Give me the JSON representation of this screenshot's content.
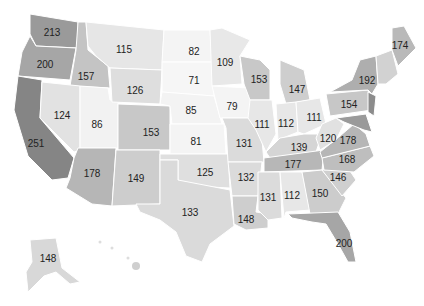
{
  "chart_data": {
    "type": "choropleth",
    "title": "",
    "colorscale": "grayscale (higher = darker)",
    "states": [
      {
        "id": "WA",
        "value": 213,
        "x": 52,
        "y": 32,
        "fill": "#9a9a9a"
      },
      {
        "id": "OR",
        "value": 200,
        "x": 45,
        "y": 64,
        "fill": "#a6a6a6"
      },
      {
        "id": "CA",
        "value": 251,
        "x": 36,
        "y": 143,
        "fill": "#858585"
      },
      {
        "id": "ID",
        "value": 157,
        "x": 86,
        "y": 76,
        "fill": "#c4c4c4"
      },
      {
        "id": "NV",
        "value": 124,
        "x": 62,
        "y": 115,
        "fill": "#e2e2e2"
      },
      {
        "id": "UT",
        "value": 86,
        "x": 97,
        "y": 124,
        "fill": "#f2f2f2"
      },
      {
        "id": "AZ",
        "value": 178,
        "x": 92,
        "y": 173,
        "fill": "#b6b6b6"
      },
      {
        "id": "MT",
        "value": 115,
        "x": 124,
        "y": 49,
        "fill": "#e6e6e6"
      },
      {
        "id": "WY",
        "value": 126,
        "x": 135,
        "y": 90,
        "fill": "#dedede"
      },
      {
        "id": "CO",
        "value": 153,
        "x": 151,
        "y": 132,
        "fill": "#c8c8c8"
      },
      {
        "id": "NM",
        "value": 149,
        "x": 136,
        "y": 178,
        "fill": "#cdcdcd"
      },
      {
        "id": "ND",
        "value": 82,
        "x": 194,
        "y": 51,
        "fill": "#f4f4f4"
      },
      {
        "id": "SD",
        "value": 71,
        "x": 194,
        "y": 80,
        "fill": "#f6f6f6"
      },
      {
        "id": "NE",
        "value": 85,
        "x": 191,
        "y": 110,
        "fill": "#f3f3f3"
      },
      {
        "id": "KS",
        "value": 81,
        "x": 196,
        "y": 141,
        "fill": "#f4f4f4"
      },
      {
        "id": "OK",
        "value": 125,
        "x": 205,
        "y": 172,
        "fill": "#dfdfdf"
      },
      {
        "id": "TX",
        "value": 133,
        "x": 190,
        "y": 212,
        "fill": "#dadada"
      },
      {
        "id": "MN",
        "value": 109,
        "x": 225,
        "y": 62,
        "fill": "#e8e8e8"
      },
      {
        "id": "IA",
        "value": 79,
        "x": 232,
        "y": 106,
        "fill": "#f4f4f4"
      },
      {
        "id": "MO",
        "value": 131,
        "x": 244,
        "y": 143,
        "fill": "#dbdbdb"
      },
      {
        "id": "AR",
        "value": 132,
        "x": 246,
        "y": 177,
        "fill": "#dbdbdb"
      },
      {
        "id": "LA",
        "value": 148,
        "x": 246,
        "y": 219,
        "fill": "#cecece"
      },
      {
        "id": "WI",
        "value": 153,
        "x": 259,
        "y": 79,
        "fill": "#c8c8c8"
      },
      {
        "id": "IL",
        "value": 111,
        "x": 262,
        "y": 124,
        "fill": "#e7e7e7"
      },
      {
        "id": "MI",
        "value": 147,
        "x": 297,
        "y": 89,
        "fill": "#cecece"
      },
      {
        "id": "IN",
        "value": 112,
        "x": 286,
        "y": 123,
        "fill": "#e7e7e7"
      },
      {
        "id": "OH",
        "value": 111,
        "x": 314,
        "y": 117,
        "fill": "#e7e7e7"
      },
      {
        "id": "KY",
        "value": 139,
        "x": 299,
        "y": 147,
        "fill": "#d5d5d5"
      },
      {
        "id": "TN",
        "value": 177,
        "x": 293,
        "y": 164,
        "fill": "#b7b7b7"
      },
      {
        "id": "MS",
        "value": 131,
        "x": 268,
        "y": 197,
        "fill": "#dbdbdb"
      },
      {
        "id": "AL",
        "value": 112,
        "x": 292,
        "y": 195,
        "fill": "#e7e7e7"
      },
      {
        "id": "GA",
        "value": 150,
        "x": 320,
        "y": 193,
        "fill": "#cccccc"
      },
      {
        "id": "FL",
        "value": 200,
        "x": 344,
        "y": 243,
        "fill": "#a6a6a6"
      },
      {
        "id": "SC",
        "value": 146,
        "x": 338,
        "y": 177,
        "fill": "#cfcfcf"
      },
      {
        "id": "NC",
        "value": 168,
        "x": 347,
        "y": 159,
        "fill": "#bebebe"
      },
      {
        "id": "VA",
        "value": 178,
        "x": 348,
        "y": 140,
        "fill": "#b6b6b6"
      },
      {
        "id": "WV",
        "value": 120,
        "x": 328,
        "y": 138,
        "fill": "#e1e1e1"
      },
      {
        "id": "PA",
        "value": 154,
        "x": 349,
        "y": 104,
        "fill": "#c7c7c7"
      },
      {
        "id": "NY",
        "value": 192,
        "x": 367,
        "y": 80,
        "fill": "#aeaeae"
      },
      {
        "id": "ME",
        "value": 174,
        "x": 400,
        "y": 45,
        "fill": "#b9b9b9"
      },
      {
        "id": "AK",
        "value": 148,
        "x": 48,
        "y": 258,
        "fill": "#d8d8d8"
      }
    ]
  }
}
